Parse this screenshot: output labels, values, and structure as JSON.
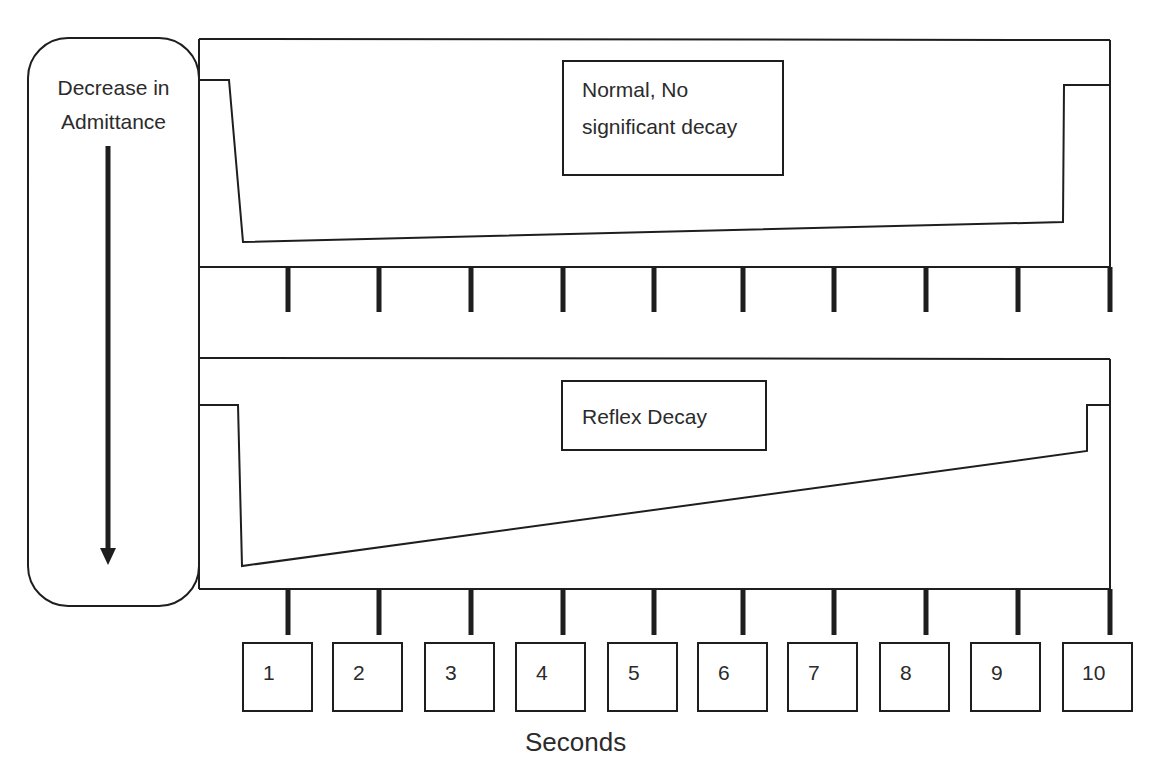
{
  "y_axis_label": {
    "line1": "Decrease in",
    "line2": "Admittance"
  },
  "x_axis_label": "Seconds",
  "panels": [
    {
      "label_line1": "Normal, No",
      "label_line2": "significant decay",
      "description": "Normal, No significant decay"
    },
    {
      "label_line1": "Reflex Decay",
      "label_line2": "",
      "description": "Reflex Decay"
    }
  ],
  "time_ticks": [
    "1",
    "2",
    "3",
    "4",
    "5",
    "6",
    "7",
    "8",
    "9",
    "10"
  ],
  "geometry": {
    "tick_x": [
      288,
      379,
      471,
      563,
      654,
      743,
      834,
      926,
      1018,
      1110
    ],
    "box_x": [
      243,
      333,
      425,
      516,
      608,
      698,
      788,
      880,
      971,
      1063
    ],
    "upper_wave": "199,80 229,80 243,242 1063,222 1064,85 1110,85",
    "lower_wave": "199,405 238,405 242,566 1087,451 1087,405 1110,405"
  },
  "colors": {
    "stroke": "#1e1e1e",
    "text": "#2b2b2b",
    "background": "#ffffff"
  }
}
